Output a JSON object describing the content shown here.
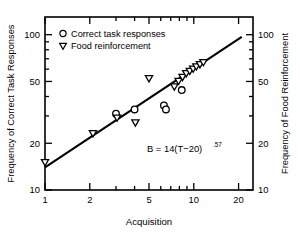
{
  "chart_data": {
    "type": "scatter",
    "title": "",
    "xlabel": "Acquisition",
    "ylabel": "Frequency of Correct Task Responses",
    "y2label": "Frequency of Food Reinforcement",
    "xscale": "log",
    "yscale": "log",
    "xlim": [
      1,
      25
    ],
    "ylim": [
      10,
      130
    ],
    "xticks_labeled": [
      1,
      2,
      5,
      10,
      20
    ],
    "xtick_labels": [
      "1",
      "2",
      "5",
      "10",
      "20"
    ],
    "xticks_minor": [
      3,
      4,
      6,
      7,
      8,
      9
    ],
    "yticks_labeled": [
      10,
      20,
      50,
      100
    ],
    "ytick_labels": [
      "10",
      "20",
      "50",
      "100"
    ],
    "yticks_minor": [
      30,
      40,
      60,
      70,
      80,
      90
    ],
    "y2ticks_labeled": [
      10,
      20,
      50,
      100
    ],
    "y2tick_labels": [
      "10",
      "20",
      "50",
      "100"
    ],
    "grid": false,
    "legend_position": "top-left",
    "legend": [
      {
        "marker": "circle",
        "label": "Correct task responses"
      },
      {
        "marker": "triangle-down",
        "label": "Food reinforcement"
      }
    ],
    "annotations": [
      {
        "text_base": "B  =  14(T−20)",
        "text_exponent": ".57",
        "x": 5.2,
        "y": 25
      }
    ],
    "series": [
      {
        "name": "Correct task responses",
        "marker": "circle",
        "points": [
          {
            "x": 3.0,
            "y": 31
          },
          {
            "x": 4.0,
            "y": 33
          },
          {
            "x": 6.3,
            "y": 35
          },
          {
            "x": 6.5,
            "y": 33
          },
          {
            "x": 8.3,
            "y": 44
          }
        ]
      },
      {
        "name": "Food reinforcement",
        "marker": "triangle-down",
        "points": [
          {
            "x": 1.0,
            "y": 15
          },
          {
            "x": 2.1,
            "y": 23
          },
          {
            "x": 3.05,
            "y": 29
          },
          {
            "x": 4.05,
            "y": 27
          },
          {
            "x": 5.0,
            "y": 52
          },
          {
            "x": 7.4,
            "y": 46
          },
          {
            "x": 7.9,
            "y": 50
          },
          {
            "x": 8.4,
            "y": 53
          },
          {
            "x": 8.9,
            "y": 56
          },
          {
            "x": 9.4,
            "y": 58
          },
          {
            "x": 9.9,
            "y": 60
          },
          {
            "x": 10.4,
            "y": 62
          },
          {
            "x": 11.0,
            "y": 64
          },
          {
            "x": 11.6,
            "y": 66
          }
        ]
      }
    ],
    "fit_line": {
      "name": "power fit",
      "from": {
        "x": 1.0,
        "y": 14
      },
      "to": {
        "x": 21.0,
        "y": 97
      }
    }
  }
}
